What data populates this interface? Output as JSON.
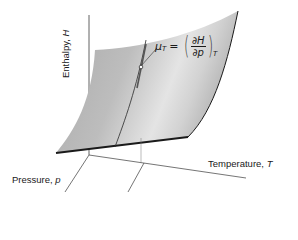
{
  "figure": {
    "type": "3d-surface-diagram",
    "axes": {
      "vertical": {
        "label": "Enthalpy, ",
        "symbol": "H"
      },
      "left": {
        "label": "Pressure, ",
        "symbol": "p"
      },
      "right": {
        "label": "Temperature, ",
        "symbol": "T"
      }
    },
    "annotation": {
      "lhs": "μ",
      "lhs_sub": "T",
      "equals": "=",
      "numerator": "∂H",
      "denominator": "∂p",
      "rhs_sub": "T",
      "description": "slope of enthalpy surface along pressure at constant temperature"
    },
    "colors": {
      "surface_light": "#e8e8e8",
      "surface_dark": "#a8a8a8",
      "edge": "#1a1a1a",
      "axis": "#3a3a3a"
    }
  }
}
